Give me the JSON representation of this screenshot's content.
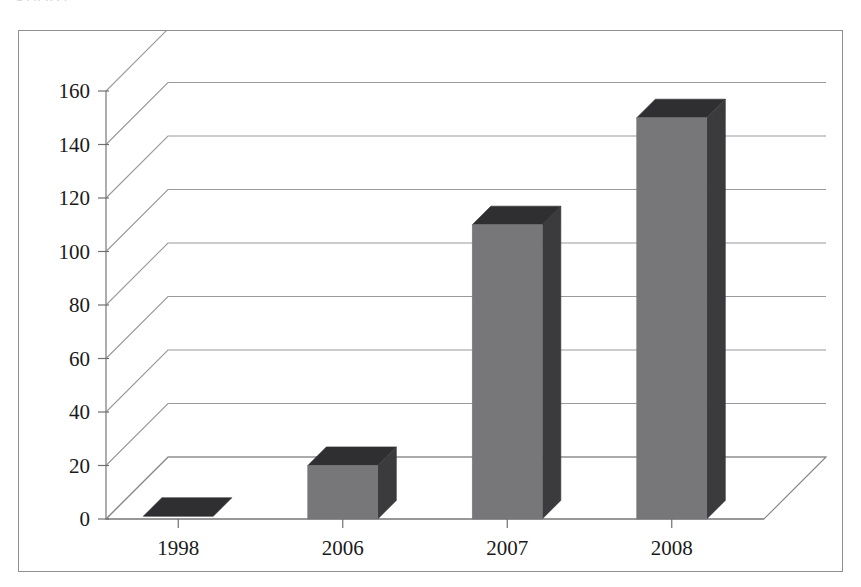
{
  "figure": {
    "cropped_header_fragment": "CHART",
    "frame_border_color": "#8e8e93",
    "background_color": "#ffffff"
  },
  "chart_data": {
    "type": "bar",
    "title": "",
    "subtitle": "",
    "xlabel": "",
    "ylabel": "",
    "categories": [
      "1998",
      "2006",
      "2007",
      "2008"
    ],
    "values": [
      1,
      20,
      110,
      150
    ],
    "series": [
      {
        "name": "Series 1",
        "values": [
          1,
          20,
          110,
          150
        ]
      }
    ],
    "ylim": [
      0,
      160
    ],
    "ytick_labels": [
      "0",
      "20",
      "40",
      "60",
      "80",
      "100",
      "120",
      "140",
      "160"
    ],
    "ytick_values": [
      0,
      20,
      40,
      60,
      80,
      100,
      120,
      140,
      160
    ],
    "grid": true,
    "legend": "none",
    "style": "3d-column",
    "colors": {
      "bar_front": "#77777a",
      "bar_side": "#3b3b3e",
      "bar_top": "#2f2f32",
      "gridline": "#9a9a9a",
      "axis": "#8a8a8a",
      "text": "#1a1a1a"
    }
  }
}
